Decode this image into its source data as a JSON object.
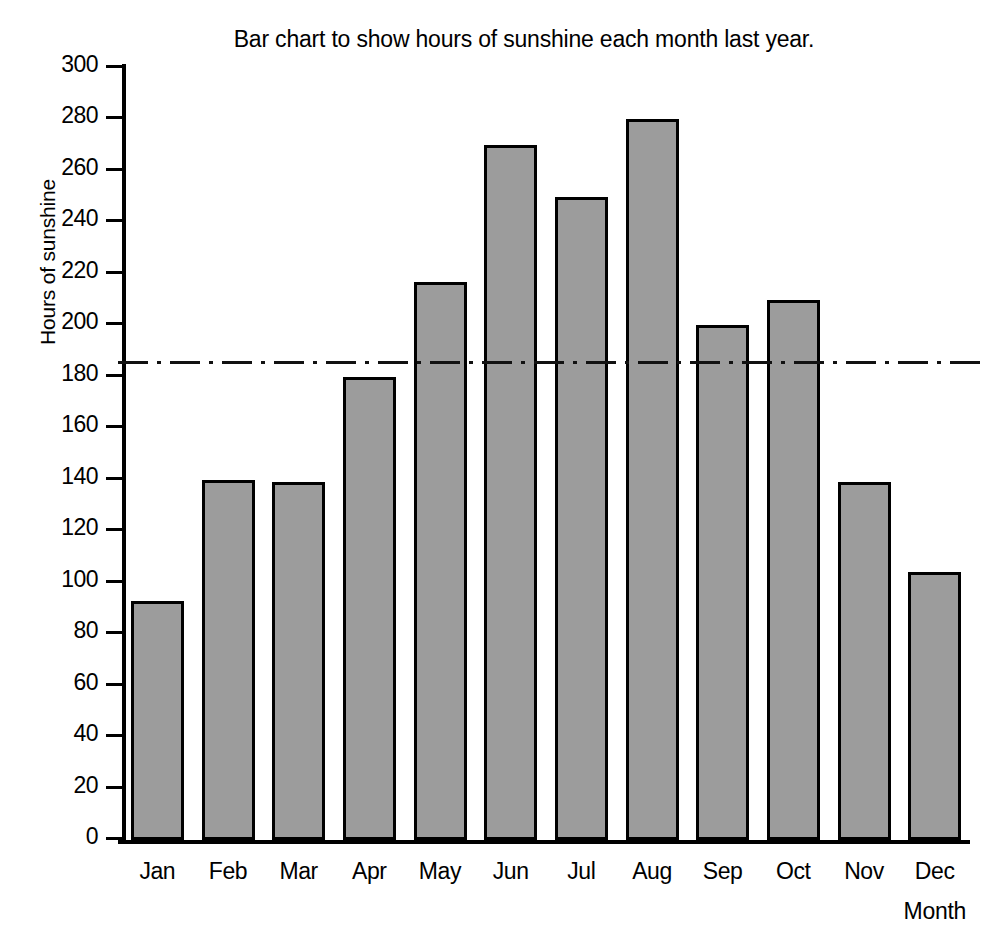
{
  "chart_data": {
    "type": "bar",
    "title": "Bar chart to show hours of sunshine each month last year.",
    "xlabel": "Month",
    "ylabel": "Hours of sunshine",
    "categories": [
      "Jan",
      "Feb",
      "Mar",
      "Apr",
      "May",
      "Jun",
      "Jul",
      "Aug",
      "Sep",
      "Oct",
      "Nov",
      "Dec"
    ],
    "values": [
      93,
      140,
      139,
      180,
      217,
      270,
      250,
      280,
      200,
      210,
      139,
      104
    ],
    "ylim": [
      0,
      300
    ],
    "ytick_step": 20,
    "ytick_labels": [
      "0",
      "20",
      "40",
      "60",
      "80",
      "100",
      "120",
      "140",
      "160",
      "180",
      "200",
      "220",
      "240",
      "260",
      "280",
      "300"
    ],
    "grid": false,
    "legend": false,
    "annotations": [
      {
        "name": "mean-reference-line",
        "style": "dash-dot",
        "value": 185,
        "label": ""
      }
    ],
    "colors": {
      "bar_fill": "#9c9c9c",
      "bar_border": "#000000",
      "axis": "#000000",
      "refline": "#111111",
      "background": "#ffffff"
    }
  }
}
